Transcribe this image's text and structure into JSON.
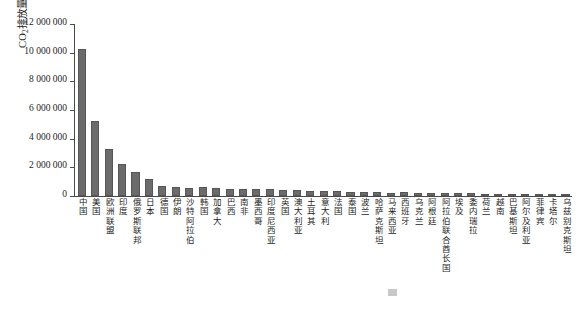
{
  "chart_data": {
    "type": "bar",
    "title": "",
    "xlabel": "",
    "ylabel": "CO2排放量/kt",
    "ylabel_prefix": "CO",
    "ylabel_sub": "2",
    "ylabel_suffix": "排放量/kt",
    "ylim": [
      0,
      12000000
    ],
    "ytick_labels": [
      "12 000 000",
      "10 000 000",
      "8 000 000",
      "6 000 000",
      "4 000 000",
      "2 000 000",
      "0"
    ],
    "ytick_values": [
      12000000,
      10000000,
      8000000,
      6000000,
      4000000,
      2000000,
      0
    ],
    "grid": false,
    "legend": "none",
    "bar_color": "#6b6b6b",
    "axis_color": "#4a4a4a",
    "categories": [
      "中国",
      "美国",
      "欧洲联盟",
      "印度",
      "俄罗斯联邦",
      "日本",
      "德国",
      "伊朗",
      "沙特阿拉伯",
      "韩国",
      "加拿大",
      "巴西",
      "南非",
      "墨西哥",
      "印度尼西亚",
      "英国",
      "澳大利亚",
      "土耳其",
      "意大利",
      "法国",
      "泰国",
      "波兰",
      "哈萨克斯坦",
      "马来西亚",
      "西班牙",
      "乌克兰",
      "阿根廷",
      "阿拉伯联合酋长国",
      "埃及",
      "委内瑞拉",
      "荷兰",
      "越南",
      "巴基斯坦",
      "阿尔及利亚",
      "菲律宾",
      "卡塔尔",
      "乌兹别克斯坦"
    ],
    "values": [
      10290000,
      5250000,
      3250000,
      2200000,
      1700000,
      1200000,
      720000,
      620000,
      560000,
      600000,
      550000,
      500000,
      470000,
      470000,
      460000,
      420000,
      390000,
      370000,
      340000,
      320000,
      300000,
      300000,
      280000,
      240000,
      250000,
      230000,
      200000,
      200000,
      200000,
      190000,
      160000,
      160000,
      160000,
      140000,
      110000,
      90000,
      110000
    ]
  },
  "caption": {
    "text": ""
  }
}
